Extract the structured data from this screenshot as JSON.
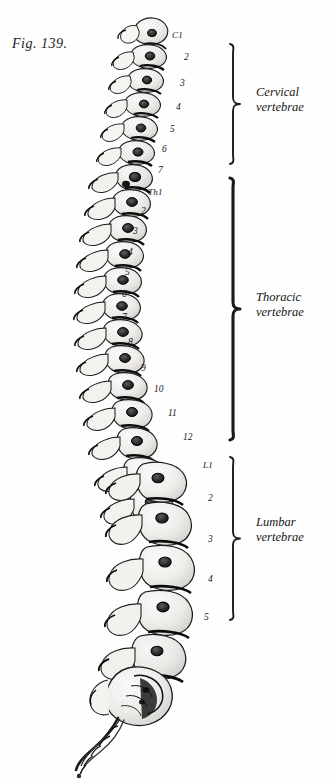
{
  "figure": {
    "caption": "Fig. 139.",
    "background_color": "#fefefe",
    "ink_color": "#1a1a1a"
  },
  "vertebra_labels": {
    "cervical": [
      {
        "text": "C1",
        "x": 172,
        "y": 31,
        "named": true
      },
      {
        "text": "2",
        "x": 184,
        "y": 53,
        "named": false
      },
      {
        "text": "3",
        "x": 180,
        "y": 79,
        "named": false
      },
      {
        "text": "4",
        "x": 176,
        "y": 103,
        "named": false
      },
      {
        "text": "5",
        "x": 170,
        "y": 125,
        "named": false
      },
      {
        "text": "6",
        "x": 162,
        "y": 145,
        "named": false
      },
      {
        "text": "7",
        "x": 158,
        "y": 166,
        "named": false
      }
    ],
    "thoracic": [
      {
        "text": "Th1",
        "x": 148,
        "y": 188,
        "named": true
      },
      {
        "text": "2",
        "x": 141,
        "y": 207,
        "named": false
      },
      {
        "text": "3",
        "x": 133,
        "y": 227,
        "named": false
      },
      {
        "text": "4",
        "x": 128,
        "y": 248,
        "named": false
      },
      {
        "text": "5",
        "x": 125,
        "y": 268,
        "named": false
      },
      {
        "text": "6",
        "x": 122,
        "y": 290,
        "named": false
      },
      {
        "text": "7",
        "x": 122,
        "y": 313,
        "named": false
      },
      {
        "text": "8",
        "x": 128,
        "y": 338,
        "named": false
      },
      {
        "text": "9",
        "x": 141,
        "y": 364,
        "named": false
      },
      {
        "text": "10",
        "x": 154,
        "y": 385,
        "named": false
      },
      {
        "text": "11",
        "x": 168,
        "y": 409,
        "named": false
      },
      {
        "text": "12",
        "x": 183,
        "y": 433,
        "named": false
      }
    ],
    "lumbar": [
      {
        "text": "L1",
        "x": 203,
        "y": 461,
        "named": true
      },
      {
        "text": "2",
        "x": 208,
        "y": 494,
        "named": false
      },
      {
        "text": "3",
        "x": 208,
        "y": 535,
        "named": false
      },
      {
        "text": "4",
        "x": 208,
        "y": 575,
        "named": false
      },
      {
        "text": "5",
        "x": 204,
        "y": 613,
        "named": false
      }
    ]
  },
  "groups": [
    {
      "name": "cervical",
      "line1": "Cervical",
      "line2": "vertebrae",
      "label_x": 256,
      "label_y": 85,
      "brace_top": 42,
      "brace_bottom": 166,
      "brace_x": 228
    },
    {
      "name": "thoracic",
      "line1": "Thoracic",
      "line2": "vertebrae",
      "label_x": 256,
      "label_y": 290,
      "brace_top": 176,
      "brace_bottom": 442,
      "brace_x": 228
    },
    {
      "name": "lumbar",
      "line1": "Lumbar",
      "line2": "vertebrae",
      "label_x": 256,
      "label_y": 515,
      "brace_top": 455,
      "brace_bottom": 622,
      "brace_x": 228
    }
  ]
}
